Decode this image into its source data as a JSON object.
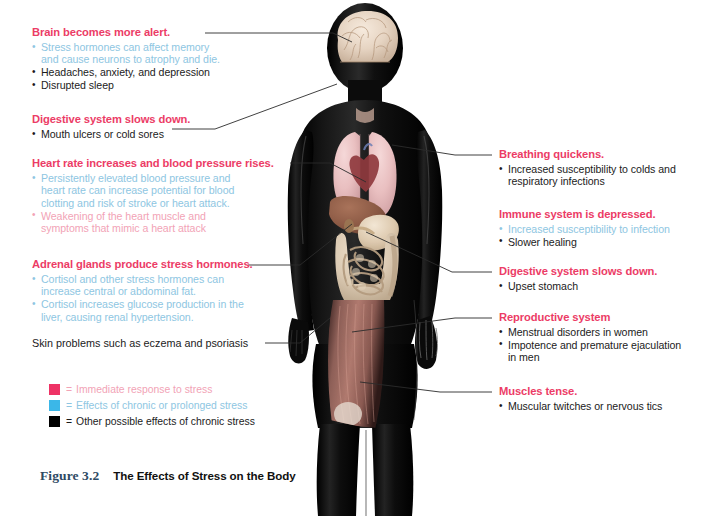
{
  "figure": {
    "number": "Figure 3.2",
    "title": "The Effects of Stress on the Body"
  },
  "colors": {
    "heading_pink": "#ec3c66",
    "immediate_pink": "#f2a3b6",
    "chronic_blue": "#8ec6e2",
    "other_black": "#1b1b1b",
    "legend_swatch_pink": "#ee3265",
    "legend_swatch_blue": "#3bb7e8",
    "legend_swatch_black": "#000000",
    "leader_line": "#2b2b2b",
    "caption_figno": "#2e4a63"
  },
  "left_annotations": [
    {
      "id": "brain",
      "heading": "Brain becomes more alert.",
      "bullets": [
        {
          "text": "Stress hormones can affect memory",
          "text2": "and cause neurons to atrophy and die.",
          "type": "chronic"
        },
        {
          "text": "Headaches, anxiety, and depression",
          "type": "other"
        },
        {
          "text": "Disrupted sleep",
          "type": "other"
        }
      ]
    },
    {
      "id": "digestive-left",
      "heading": "Digestive system slows down.",
      "bullets": [
        {
          "text": "Mouth ulcers or cold sores",
          "type": "other"
        }
      ]
    },
    {
      "id": "heart",
      "heading": "Heart rate increases and blood pressure rises.",
      "bullets": [
        {
          "text": "Persistently elevated blood pressure and",
          "text2": "heart rate can increase potential for blood",
          "text3": "clotting and risk of stroke or heart attack.",
          "type": "chronic"
        },
        {
          "text": "Weakening of the heart muscle and",
          "text2": "symptoms that mimic a heart attack",
          "type": "immediate"
        }
      ]
    },
    {
      "id": "adrenal",
      "heading": "Adrenal glands produce stress hormones.",
      "bullets": [
        {
          "text": "Cortisol and other stress hormones can",
          "text2": "increase central or abdominal fat.",
          "type": "chronic"
        },
        {
          "text": "Cortisol increases glucose production in the",
          "text2": "liver, causing renal hypertension.",
          "type": "chronic"
        }
      ]
    }
  ],
  "left_plain_note": "Skin problems such as eczema and psoriasis",
  "right_annotations": [
    {
      "id": "breathing",
      "heading": "Breathing quickens.",
      "bullets": [
        {
          "text": "Increased susceptibility to colds and",
          "text2": "respiratory infections",
          "type": "other"
        }
      ]
    },
    {
      "id": "immune",
      "heading": "Immune system is depressed.",
      "bullets": [
        {
          "text": "Increased susceptibility to infection",
          "type": "chronic"
        },
        {
          "text": "Slower healing",
          "type": "other"
        }
      ]
    },
    {
      "id": "digestive-right",
      "heading": "Digestive system slows down.",
      "bullets": [
        {
          "text": "Upset stomach",
          "type": "other"
        }
      ]
    },
    {
      "id": "reproductive",
      "heading": "Reproductive system",
      "bullets": [
        {
          "text": "Menstrual disorders in women",
          "type": "other"
        },
        {
          "text": "Impotence and premature ejaculation",
          "text2": "in men",
          "type": "other"
        }
      ]
    },
    {
      "id": "muscles",
      "heading": "Muscles tense.",
      "bullets": [
        {
          "text": "Muscular twitches or nervous tics",
          "type": "other"
        }
      ]
    }
  ],
  "legend": [
    {
      "swatch": "#ee3265",
      "equals": "=",
      "label": "Immediate response to stress",
      "text_color": "#f2a3b6"
    },
    {
      "swatch": "#3bb7e8",
      "equals": "=",
      "label": "Effects of chronic or prolonged stress",
      "text_color": "#8ec6e2"
    },
    {
      "swatch": "#000000",
      "equals": "=",
      "label": "Other possible effects of chronic stress",
      "text_color": "#1b1b1b"
    }
  ]
}
